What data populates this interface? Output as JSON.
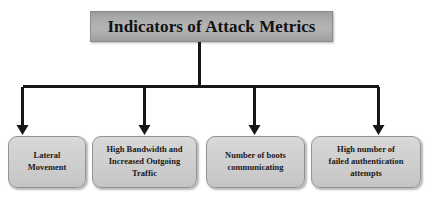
{
  "diagram": {
    "type": "tree-hierarchy",
    "orientation": "top-down",
    "root": {
      "label": "Indicators of Attack Metrics"
    },
    "children": [
      {
        "label": "Lateral\nMovement"
      },
      {
        "label": "High Bandwidth and\nIncreased Outgoing\nTraffic"
      },
      {
        "label": "Number of boots\ncommunicating"
      },
      {
        "label": "High number of\nfailed authentication\nattempts"
      }
    ],
    "colors": {
      "root_fill": "#ababab",
      "leaf_fill": "#d2d2d2",
      "border": "#8d8d8d",
      "connector": "#161616",
      "text": "#111111",
      "background": "#ffffff"
    }
  }
}
